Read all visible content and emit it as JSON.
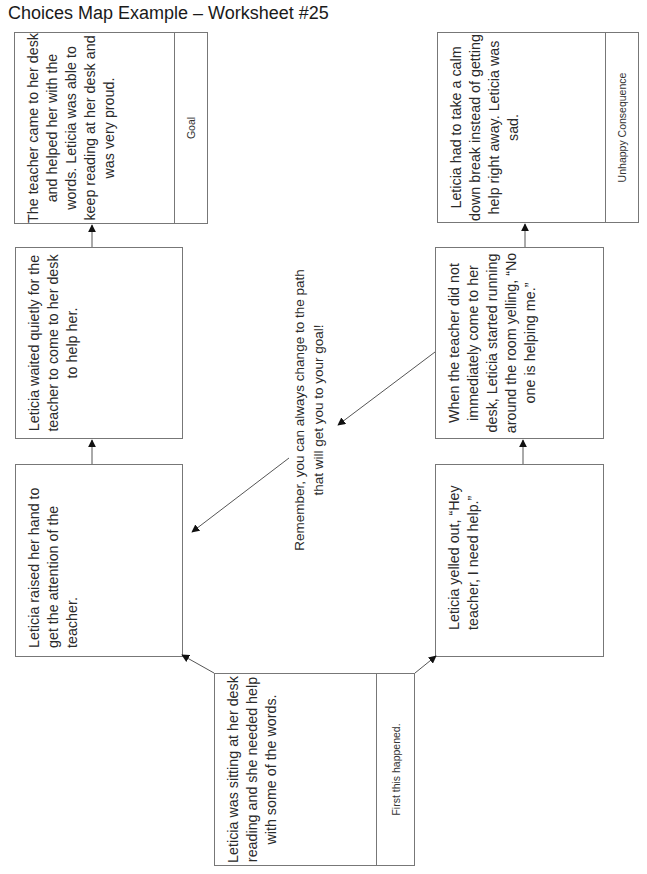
{
  "title": "Choices Map Example – Worksheet #25",
  "boxes": {
    "start": {
      "text": "Leticia was sitting at her desk reading and she needed help with some of the words.",
      "label": "First this happened."
    },
    "positive_choice": {
      "text": "Leticia raised her hand to get the attention of the teacher."
    },
    "positive_followup": {
      "text": "Leticia waited quietly for the teacher to come to her desk to help her."
    },
    "goal": {
      "text": "The teacher came to her desk and helped her with the words. Leticia was able to keep reading at her desk and was very proud.",
      "label": "Goal"
    },
    "negative_choice": {
      "text": "Leticia yelled out, “Hey teacher, I need help.”"
    },
    "negative_followup": {
      "text": "When the teacher did not immediately come to her desk, Leticia started running around the room yelling, “No one is helping me.”"
    },
    "unhappy": {
      "text": "Leticia had to take a calm down break instead of getting help right away. Leticia was sad.",
      "label": "Unhappy Consequence"
    }
  },
  "note": "Remember, you can always change to the path that will get you to your goal!",
  "colors": {
    "border": "#777777",
    "text": "#2a2a2a",
    "arrow": "#555555",
    "arrowhead": "#111111"
  }
}
